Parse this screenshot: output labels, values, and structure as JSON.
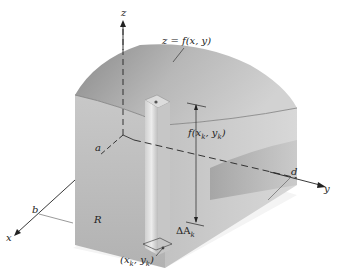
{
  "figure": {
    "axes": {
      "x": "x",
      "y": "y",
      "z": "z"
    },
    "bounds": {
      "a": "a",
      "b": "b",
      "c": "c",
      "d": "d"
    },
    "surface_label": "z = f(x,  y)",
    "region_label": "R",
    "height_label": "f(x",
    "height_label_sub": "k",
    "height_label_mid": ",  y",
    "height_label_sub2": "k",
    "height_label_end": ")",
    "point_label": "(x",
    "point_label_sub": "k",
    "point_label_mid": ",  y",
    "point_label_sub2": "k",
    "point_label_end": ")",
    "area_label": "ΔA",
    "area_label_sub": "k",
    "colors": {
      "surface_dark": "#8e8e8e",
      "surface_light": "#d6d6d6",
      "wall": "#c4c4c4",
      "column": "#e6e6e6",
      "axis": "#222222"
    }
  }
}
